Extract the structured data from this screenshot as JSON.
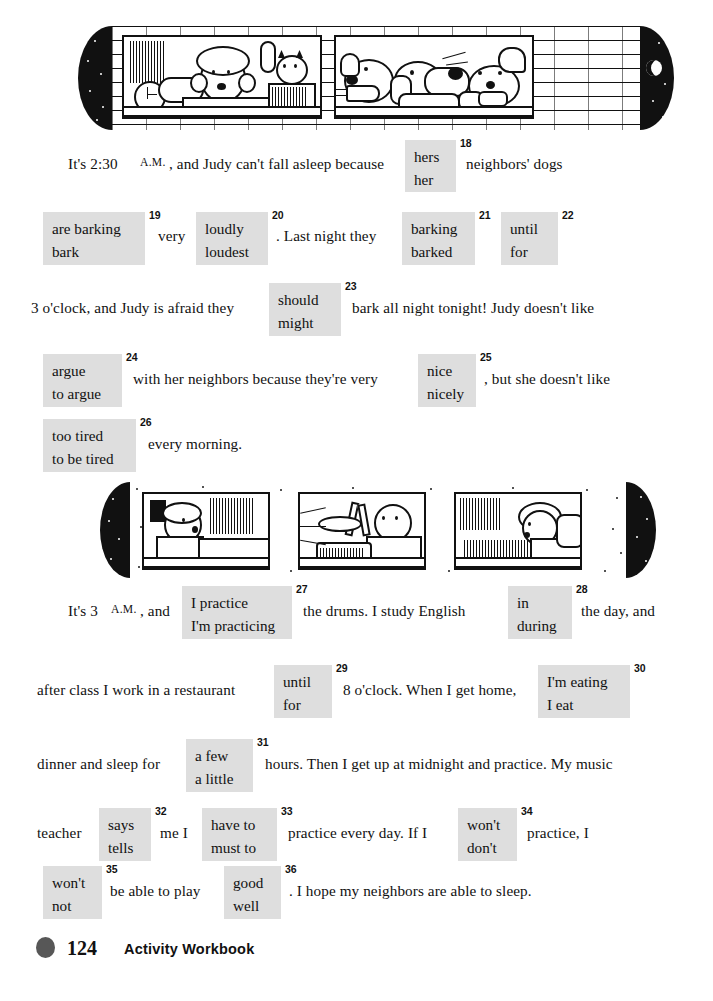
{
  "page": {
    "number": "124",
    "title": "Activity Workbook"
  },
  "illustrations": [
    {
      "name": "judy-awake-and-barking-dogs",
      "panels": [
        "woman-awake-in-bed-with-cat-and-alarm-clock",
        "three-dogs-barking-at-window"
      ]
    },
    {
      "name": "neighbor-drumming-at-night",
      "panels": [
        "man-awake-in-bed",
        "boy-playing-drums",
        "woman-awake-in-bed"
      ]
    }
  ],
  "exercise_one": {
    "rows": [
      {
        "segments": [
          {
            "type": "text",
            "value": "It's 2:30 ",
            "x": 68,
            "y": 155
          },
          {
            "type": "smallcaps",
            "value": "A.M.",
            "x": 140,
            "y": 156
          },
          {
            "type": "text",
            "value": ", and Judy can't fall asleep because",
            "x": 169,
            "y": 155
          },
          {
            "type": "choice",
            "number": "18",
            "options": [
              "hers",
              "her"
            ],
            "x": 405,
            "y": 140,
            "w": 51,
            "h": 52
          },
          {
            "type": "text",
            "value": "neighbors' dogs",
            "x": 466,
            "y": 155
          }
        ]
      },
      {
        "segments": [
          {
            "type": "choice",
            "number": "19",
            "options": [
              "are barking",
              "bark"
            ],
            "x": 43,
            "y": 212,
            "w": 102,
            "h": 53
          },
          {
            "type": "text",
            "value": "very",
            "x": 158,
            "y": 227
          },
          {
            "type": "choice",
            "number": "20",
            "options": [
              "loudly",
              "loudest"
            ],
            "x": 196,
            "y": 212,
            "w": 72,
            "h": 53
          },
          {
            "type": "text",
            "value": ". Last night they",
            "x": 276,
            "y": 227
          },
          {
            "type": "choice",
            "number": "21",
            "options": [
              "barking",
              "barked"
            ],
            "x": 402,
            "y": 212,
            "w": 73,
            "h": 53
          },
          {
            "type": "choice",
            "number": "22",
            "options": [
              "until",
              "for"
            ],
            "x": 501,
            "y": 212,
            "w": 57,
            "h": 53
          }
        ]
      },
      {
        "segments": [
          {
            "type": "text",
            "value": "3 o'clock, and Judy is afraid they",
            "x": 31,
            "y": 299
          },
          {
            "type": "choice",
            "number": "23",
            "options": [
              "should",
              "might"
            ],
            "x": 269,
            "y": 283,
            "w": 72,
            "h": 53
          },
          {
            "type": "text",
            "value": "bark all night tonight!  Judy doesn't like",
            "x": 352,
            "y": 299
          }
        ]
      },
      {
        "segments": [
          {
            "type": "choice",
            "number": "24",
            "options": [
              "argue",
              "to argue"
            ],
            "x": 43,
            "y": 354,
            "w": 79,
            "h": 53
          },
          {
            "type": "text",
            "value": "with her neighbors because they're very",
            "x": 133,
            "y": 370
          },
          {
            "type": "choice",
            "number": "25",
            "options": [
              "nice",
              "nicely"
            ],
            "x": 418,
            "y": 354,
            "w": 58,
            "h": 53
          },
          {
            "type": "text",
            "value": ", but she doesn't like",
            "x": 484,
            "y": 370
          }
        ]
      },
      {
        "segments": [
          {
            "type": "choice",
            "number": "26",
            "options": [
              "too tired",
              "to be tired"
            ],
            "x": 43,
            "y": 419,
            "w": 93,
            "h": 53
          },
          {
            "type": "text",
            "value": "every morning.",
            "x": 148,
            "y": 435
          }
        ]
      }
    ]
  },
  "exercise_two": {
    "rows": [
      {
        "segments": [
          {
            "type": "text",
            "value": "It's 3 ",
            "x": 68,
            "y": 602
          },
          {
            "type": "smallcaps",
            "value": "A.M.",
            "x": 111,
            "y": 603
          },
          {
            "type": "text",
            "value": ", and",
            "x": 140,
            "y": 602
          },
          {
            "type": "choice",
            "number": "27",
            "options": [
              "I practice",
              "I'm practicing"
            ],
            "x": 182,
            "y": 586,
            "w": 110,
            "h": 53
          },
          {
            "type": "text",
            "value": "the drums.  I study English",
            "x": 303,
            "y": 602
          },
          {
            "type": "choice",
            "number": "28",
            "options": [
              "in",
              "during"
            ],
            "x": 508,
            "y": 586,
            "w": 64,
            "h": 53
          },
          {
            "type": "text",
            "value": "the day, and",
            "x": 581,
            "y": 602
          }
        ]
      },
      {
        "segments": [
          {
            "type": "text",
            "value": "after class I work in a restaurant",
            "x": 37,
            "y": 681
          },
          {
            "type": "choice",
            "number": "29",
            "options": [
              "until",
              "for"
            ],
            "x": 274,
            "y": 665,
            "w": 58,
            "h": 53
          },
          {
            "type": "text",
            "value": "8 o'clock.  When I get home,",
            "x": 343,
            "y": 681
          },
          {
            "type": "choice",
            "number": "30",
            "options": [
              "I'm eating",
              "I eat"
            ],
            "x": 538,
            "y": 665,
            "w": 92,
            "h": 53
          }
        ]
      },
      {
        "segments": [
          {
            "type": "text",
            "value": "dinner and sleep for",
            "x": 37,
            "y": 755
          },
          {
            "type": "choice",
            "number": "31",
            "options": [
              "a few",
              "a little"
            ],
            "x": 186,
            "y": 739,
            "w": 67,
            "h": 53
          },
          {
            "type": "text",
            "value": "hours.  Then I get up at midnight and practice.  My music",
            "x": 265,
            "y": 755
          }
        ]
      },
      {
        "segments": [
          {
            "type": "text",
            "value": "teacher",
            "x": 37,
            "y": 824
          },
          {
            "type": "choice",
            "number": "32",
            "options": [
              "says",
              "tells"
            ],
            "x": 99,
            "y": 808,
            "w": 52,
            "h": 53
          },
          {
            "type": "text",
            "value": "me I",
            "x": 160,
            "y": 824
          },
          {
            "type": "choice",
            "number": "33",
            "options": [
              "have to",
              "must to"
            ],
            "x": 202,
            "y": 808,
            "w": 75,
            "h": 53
          },
          {
            "type": "text",
            "value": "practice every day.  If I",
            "x": 288,
            "y": 824
          },
          {
            "type": "choice",
            "number": "34",
            "options": [
              "won't",
              "don't"
            ],
            "x": 458,
            "y": 808,
            "w": 59,
            "h": 53
          },
          {
            "type": "text",
            "value": "practice, I",
            "x": 527,
            "y": 824
          }
        ]
      },
      {
        "segments": [
          {
            "type": "choice",
            "number": "35",
            "options": [
              "won't",
              "not"
            ],
            "x": 43,
            "y": 866,
            "w": 59,
            "h": 53
          },
          {
            "type": "text",
            "value": "be able to play",
            "x": 110,
            "y": 882
          },
          {
            "type": "choice",
            "number": "36",
            "options": [
              "good",
              "well"
            ],
            "x": 224,
            "y": 866,
            "w": 57,
            "h": 53
          },
          {
            "type": "text",
            "value": ".  I hope my neighbors are able to sleep.",
            "x": 289,
            "y": 882
          }
        ]
      }
    ]
  },
  "colors": {
    "choice_background": "#dedede",
    "ink": "#111111",
    "footer_dot": "#575757",
    "paper": "#ffffff"
  }
}
